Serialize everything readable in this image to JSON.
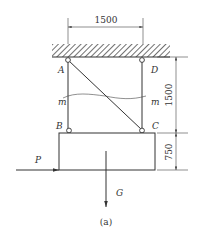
{
  "diagram": {
    "caption": "(a)",
    "dimensions": {
      "top_width": "1500",
      "right_upper_height": "1500",
      "right_lower_height": "750"
    },
    "nodes": {
      "A": "A",
      "B": "B",
      "C": "C",
      "D": "D"
    },
    "section_labels": {
      "left": "m",
      "right": "m"
    },
    "forces": {
      "horizontal": "P",
      "gravity": "G"
    },
    "colors": {
      "line": "#333333",
      "background": "#ffffff"
    }
  }
}
